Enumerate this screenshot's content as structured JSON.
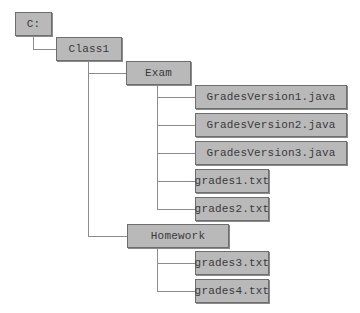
{
  "diagram": {
    "type": "directory-tree",
    "root": {
      "label": "C:",
      "children": [
        {
          "label": "Class1",
          "children": [
            {
              "label": "Exam",
              "children": [
                {
                  "label": "GradesVersion1.java"
                },
                {
                  "label": "GradesVersion2.java"
                },
                {
                  "label": "GradesVersion3.java"
                },
                {
                  "label": "grades1.txt"
                },
                {
                  "label": "grades2.txt"
                }
              ]
            },
            {
              "label": "Homework",
              "children": [
                {
                  "label": "grades3.txt"
                },
                {
                  "label": "grades4.txt"
                }
              ]
            }
          ]
        }
      ]
    },
    "nodes": {
      "root": "C:",
      "class1": "Class1",
      "exam": "Exam",
      "gv1": "GradesVersion1.java",
      "gv2": "GradesVersion2.java",
      "gv3": "GradesVersion3.java",
      "grades1": "grades1.txt",
      "grades2": "grades2.txt",
      "homework": "Homework",
      "grades3": "grades3.txt",
      "grades4": "grades4.txt"
    },
    "colors": {
      "node_fill": "#b9b9b9",
      "node_border": "#6e6e6e",
      "connector": "#8c8c8c",
      "text": "#3a3a3a"
    }
  }
}
